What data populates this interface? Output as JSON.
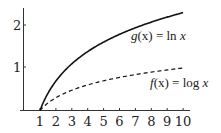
{
  "chart_data": {
    "type": "line",
    "title": "",
    "xlabel": "",
    "ylabel": "",
    "xlim": [
      0,
      10
    ],
    "ylim": [
      0,
      2.35
    ],
    "grid": false,
    "x_ticks": [
      "1",
      "2",
      "3",
      "4",
      "5",
      "6",
      "7",
      "8",
      "9",
      "10"
    ],
    "y_ticks": [
      "1",
      "2"
    ],
    "series": [
      {
        "name": "g(x) = ln x",
        "style": "solid",
        "x": [
          1,
          2,
          3,
          4,
          5,
          6,
          7,
          8,
          9,
          10
        ],
        "values": [
          0,
          0.693,
          1.099,
          1.386,
          1.609,
          1.792,
          1.946,
          2.079,
          2.197,
          2.303
        ]
      },
      {
        "name": "f(x) = log x",
        "style": "dashed",
        "x": [
          1,
          2,
          3,
          4,
          5,
          6,
          7,
          8,
          9,
          10
        ],
        "values": [
          0,
          0.301,
          0.477,
          0.602,
          0.699,
          0.778,
          0.845,
          0.903,
          0.954,
          1.0
        ]
      }
    ],
    "annotations": [
      {
        "text": "g(x) = ln x",
        "near": "solid curve"
      },
      {
        "text": "f(x) = log x",
        "near": "dashed curve"
      }
    ]
  },
  "labels": {
    "g_name": "g",
    "g_arg": "(x) = ",
    "g_fn": "ln",
    "g_var": " x",
    "f_name": "f",
    "f_arg": "(x) = ",
    "f_fn": "log",
    "f_var": " x",
    "y1": "1",
    "y2": "2",
    "x": [
      "1",
      "2",
      "3",
      "4",
      "5",
      "6",
      "7",
      "8",
      "9",
      "10"
    ]
  }
}
